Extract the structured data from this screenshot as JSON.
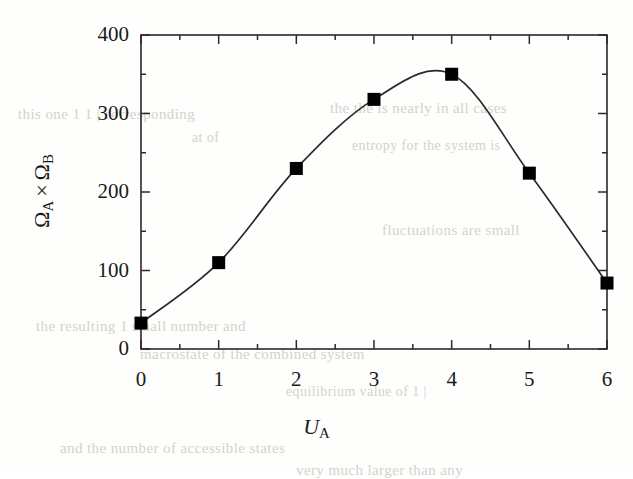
{
  "figure": {
    "background_color": "#fefefd",
    "ink_color": "#1a1a1a",
    "line_color": "#2a2a2a",
    "marker_color": "#000000"
  },
  "chart_data": {
    "type": "line",
    "title": "",
    "subtitle": "",
    "xlabel": "U_A",
    "ylabel": "Ω_A × Ω_B",
    "xlabel_parts": {
      "variable": "U",
      "subscript": "A"
    },
    "ylabel_parts": {
      "first_symbol": "Ω",
      "first_subscript": "A",
      "operator": "×",
      "second_symbol": "Ω",
      "second_subscript": "B"
    },
    "x": [
      0,
      1,
      2,
      3,
      4,
      5,
      6
    ],
    "values": [
      33,
      110,
      230,
      318,
      350,
      224,
      84
    ],
    "series": [
      {
        "name": "Omega_A x Omega_B",
        "marker": "filled-square",
        "line_style": "solid",
        "values": [
          33,
          110,
          230,
          318,
          350,
          224,
          84
        ]
      }
    ],
    "xlim": [
      0,
      6
    ],
    "ylim": [
      0,
      400
    ],
    "xticks": [
      0,
      1,
      2,
      3,
      4,
      5,
      6
    ],
    "xtick_labels": [
      "0",
      "1",
      "2",
      "3",
      "4",
      "5",
      "6"
    ],
    "x_minor_ticks": [
      0.5,
      1.5,
      2.5,
      3.5,
      4.5,
      5.5
    ],
    "yticks": [
      0,
      100,
      200,
      300,
      400
    ],
    "ytick_labels": [
      "0",
      "100",
      "200",
      "300",
      "400"
    ],
    "y_minor_ticks": [
      50,
      150,
      250,
      350
    ],
    "grid": false,
    "legend": null,
    "legend_position": "none",
    "frame": "box",
    "peak": {
      "x": 3.75,
      "y": 355
    },
    "annotations": []
  },
  "bleed_through_text": [
    {
      "text": "this  one  1 1 |    corresponding",
      "x": 18,
      "y": 106,
      "size": 15
    },
    {
      "text": "the  the   is   nearly  in  all  cases",
      "x": 330,
      "y": 100,
      "size": 15
    },
    {
      "text": "at   of",
      "x": 192,
      "y": 130,
      "size": 14
    },
    {
      "text": "entropy  for   the  system   is",
      "x": 352,
      "y": 138,
      "size": 14
    },
    {
      "text": "fluctuations  are  small",
      "x": 382,
      "y": 222,
      "size": 15
    },
    {
      "text": "the   resulting  1  small  number   and",
      "x": 36,
      "y": 318,
      "size": 15
    },
    {
      "text": "macrostate  of   the  combined   system",
      "x": 140,
      "y": 346,
      "size": 15
    },
    {
      "text": "equilibrium  value  of  1 |",
      "x": 286,
      "y": 384,
      "size": 14
    },
    {
      "text": "and   the   number   of   accessible   states",
      "x": 60,
      "y": 440,
      "size": 15
    },
    {
      "text": "very   much   larger   than   any",
      "x": 296,
      "y": 462,
      "size": 15
    }
  ]
}
